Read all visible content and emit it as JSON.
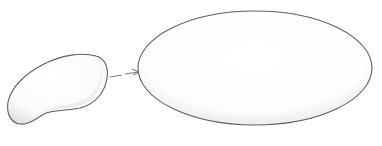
{
  "diagram": {
    "style": "pencil-sketch",
    "background": "#ffffff",
    "stroke_color": "#6b6b6b",
    "shade_color": "#d9d9d9",
    "nodes": [
      {
        "id": "source",
        "shape": "bean",
        "label": ""
      },
      {
        "id": "target",
        "shape": "ellipse",
        "label": ""
      }
    ],
    "edges": [
      {
        "from": "source",
        "to": "target",
        "style": "dashed-arrow",
        "label": ""
      }
    ]
  }
}
